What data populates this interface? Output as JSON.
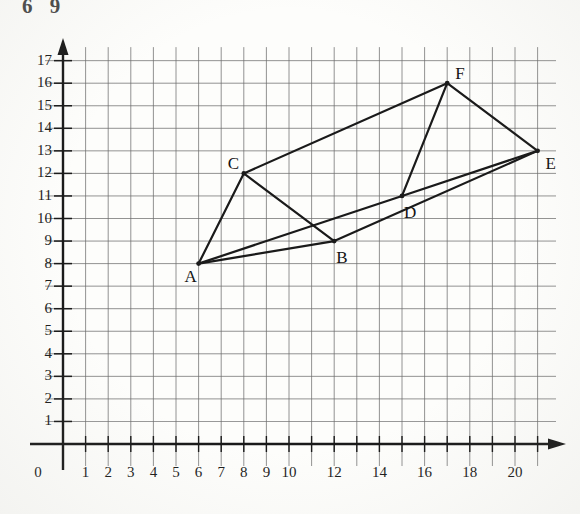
{
  "page": {
    "top_cut_mark": "6 9",
    "background_color": "#fdfdfb",
    "ink_color": "#1a1a1a",
    "grid_color": "#6d6d6d"
  },
  "axes": {
    "x_axis_name": "x-axis",
    "y_axis_name": "y-axis",
    "origin_label": "0",
    "x_tick_labels": [
      "1",
      "2",
      "3",
      "4",
      "5",
      "6",
      "7",
      "8",
      "9",
      "10",
      "12",
      "14",
      "16",
      "18",
      "20"
    ],
    "x_tick_values": [
      1,
      2,
      3,
      4,
      5,
      6,
      7,
      8,
      9,
      10,
      12,
      14,
      16,
      18,
      20
    ],
    "y_tick_labels": [
      "1",
      "2",
      "3",
      "4",
      "5",
      "6",
      "7",
      "8",
      "9",
      "10",
      "11",
      "12",
      "13",
      "14",
      "15",
      "16",
      "17"
    ],
    "y_tick_values": [
      1,
      2,
      3,
      4,
      5,
      6,
      7,
      8,
      9,
      10,
      11,
      12,
      13,
      14,
      15,
      16,
      17
    ]
  },
  "chart_data": {
    "type": "scatter",
    "title": "",
    "xlabel": "",
    "ylabel": "",
    "xlim": [
      0,
      21.5
    ],
    "ylim": [
      0,
      17.5
    ],
    "grid": true,
    "grid_step_x": 1,
    "grid_step_y": 1,
    "legend": "none",
    "points": [
      {
        "label": "A",
        "x": 6,
        "y": 8,
        "label_dx": -14,
        "label_dy": 12
      },
      {
        "label": "B",
        "x": 12,
        "y": 9,
        "label_dx": 2,
        "label_dy": 16
      },
      {
        "label": "C",
        "x": 8,
        "y": 12,
        "label_dx": -16,
        "label_dy": -10
      },
      {
        "label": "D",
        "x": 15,
        "y": 11,
        "label_dx": 2,
        "label_dy": 16
      },
      {
        "label": "E",
        "x": 21,
        "y": 13,
        "label_dx": 8,
        "label_dy": 12
      },
      {
        "label": "F",
        "x": 17,
        "y": 16,
        "label_dx": 8,
        "label_dy": -10
      }
    ],
    "edges": [
      [
        "A",
        "C"
      ],
      [
        "A",
        "B"
      ],
      [
        "A",
        "D"
      ],
      [
        "C",
        "B"
      ],
      [
        "C",
        "F"
      ],
      [
        "B",
        "E"
      ],
      [
        "D",
        "F"
      ],
      [
        "D",
        "E"
      ],
      [
        "F",
        "E"
      ]
    ]
  }
}
